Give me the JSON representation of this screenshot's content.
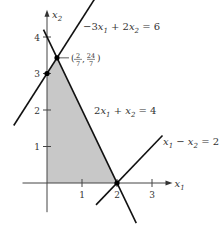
{
  "chart_data": {
    "type": "line",
    "title": "",
    "xlabel": "x",
    "xlabel_sub": "1",
    "ylabel": "x",
    "ylabel_sub": "2",
    "xlim": [
      -0.7,
      3.3
    ],
    "ylim": [
      -0.8,
      4.5
    ],
    "x_ticks": [
      1,
      2,
      3
    ],
    "y_ticks": [
      1,
      2,
      3,
      4
    ],
    "grid": false,
    "lines": [
      {
        "name": "-3x1 + 2x2 = 6",
        "label_parts": [
          "−3",
          "x",
          "1",
          " + 2",
          "x",
          "2",
          " = 6"
        ],
        "a": -3,
        "b": 2,
        "c": 6,
        "x_range": [
          -0.95,
          1.45
        ]
      },
      {
        "name": "2x1 + x2 = 4",
        "label_parts": [
          "2",
          "x",
          "1",
          " + ",
          "x",
          "2",
          " = 4"
        ],
        "a": 2,
        "b": 1,
        "c": 4,
        "x_range": [
          -0.1,
          2.55
        ]
      },
      {
        "name": "x1 - x2 = 2",
        "label_parts": [
          "",
          "x",
          "1",
          " − ",
          "x",
          "2",
          " = 2"
        ],
        "a": 1,
        "b": -1,
        "c": 2,
        "x_range": [
          1.4,
          3.3
        ]
      }
    ],
    "feasible_region": [
      [
        0,
        0
      ],
      [
        0,
        3
      ],
      [
        0.2857,
        3.4286
      ],
      [
        2,
        0
      ]
    ],
    "points": [
      {
        "x": 0,
        "y": 3,
        "label": ""
      },
      {
        "x": 0.2857,
        "y": 3.4286,
        "label": "(2/7, 24/7)",
        "label_num1": "2",
        "label_den1": "7",
        "label_num2": "24",
        "label_den2": "7"
      },
      {
        "x": 2,
        "y": 0,
        "label": ""
      }
    ],
    "region_color": "#c8c8c8",
    "line_color": "#111111"
  }
}
